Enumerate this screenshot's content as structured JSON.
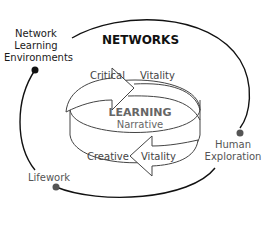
{
  "diagram": {
    "title": "NETWORKS",
    "center": {
      "heading": "LEARNING",
      "subheading": "Narrative"
    },
    "top_arrow": {
      "left_label": "Critical",
      "right_label": "Vitality"
    },
    "bottom_arrow": {
      "left_label": "Creative",
      "right_label": "Vitality"
    },
    "nodes": [
      {
        "id": "network-learning-environments",
        "lines": [
          "Network",
          "Learning",
          "Environments"
        ],
        "dot_color": "#111111"
      },
      {
        "id": "human-exploration",
        "lines": [
          "Human",
          "Exploration"
        ],
        "dot_color": "#555555"
      },
      {
        "id": "lifework",
        "lines": [
          "Lifework"
        ],
        "dot_color": "#555555"
      }
    ],
    "colors": {
      "outline": "#111111",
      "inner_stroke": "#444444",
      "center_text": "#666666"
    }
  }
}
